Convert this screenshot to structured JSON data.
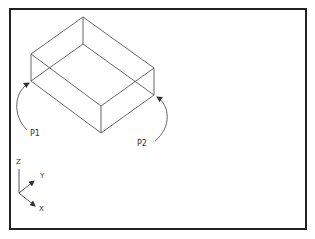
{
  "figure": {
    "frame": {
      "x": 10,
      "y": 9,
      "width": 296,
      "height": 220,
      "color": "#222222"
    },
    "box": {
      "line_color": "#555555",
      "top": {
        "back": [
          83,
          17
        ],
        "left": [
          31,
          54
        ],
        "right": [
          154,
          68
        ],
        "front": [
          101,
          106
        ]
      },
      "bottom": {
        "back": [
          83,
          44
        ],
        "left": [
          31,
          81
        ],
        "right": [
          154,
          95
        ],
        "front": [
          101,
          133
        ]
      }
    },
    "points": [
      {
        "label": "P1",
        "x": 31,
        "y": 130
      },
      {
        "label": "P2",
        "x": 137,
        "y": 139
      }
    ],
    "axes": {
      "z_label": "Z",
      "y_label": "Y",
      "x_label": "X"
    }
  }
}
